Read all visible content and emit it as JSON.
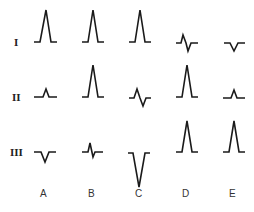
{
  "figure": {
    "row_labels": [
      "I",
      "II",
      "III"
    ],
    "column_labels": [
      "A",
      "B",
      "C",
      "D",
      "E"
    ],
    "colors": {
      "stroke": "#1a1a1a",
      "background": "#ffffff"
    },
    "cells": [
      {
        "row": "I",
        "col": "A",
        "shape": "tall-upright"
      },
      {
        "row": "I",
        "col": "B",
        "shape": "tall-upright"
      },
      {
        "row": "I",
        "col": "C",
        "shape": "tall-upright"
      },
      {
        "row": "I",
        "col": "D",
        "shape": "small-biphasic"
      },
      {
        "row": "I",
        "col": "E",
        "shape": "small-inverted"
      },
      {
        "row": "II",
        "col": "A",
        "shape": "small-upright"
      },
      {
        "row": "II",
        "col": "B",
        "shape": "tall-upright"
      },
      {
        "row": "II",
        "col": "C",
        "shape": "small-biphasic"
      },
      {
        "row": "II",
        "col": "D",
        "shape": "tall-upright"
      },
      {
        "row": "II",
        "col": "E",
        "shape": "small-upright"
      },
      {
        "row": "III",
        "col": "A",
        "shape": "small-inverted"
      },
      {
        "row": "III",
        "col": "B",
        "shape": "small-biphasic"
      },
      {
        "row": "III",
        "col": "C",
        "shape": "deep-inverted"
      },
      {
        "row": "III",
        "col": "D",
        "shape": "tall-upright"
      },
      {
        "row": "III",
        "col": "E",
        "shape": "tall-upright"
      }
    ]
  }
}
